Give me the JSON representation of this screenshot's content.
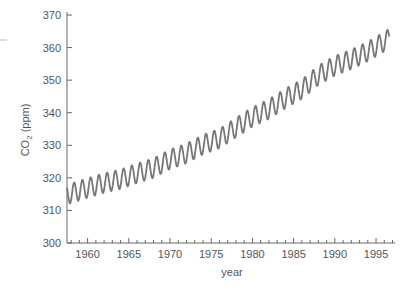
{
  "chart_data": {
    "type": "line",
    "title": "",
    "xlabel": "year",
    "ylabel": "CO2 (ppm)",
    "ylabel_main": "CO",
    "ylabel_sub": "2",
    "ylabel_unit": " (ppm)",
    "xlim": [
      1957.5,
      1997.3
    ],
    "ylim": [
      300,
      370
    ],
    "grid": false,
    "legend": null,
    "x_ticks": [
      1960,
      1965,
      1970,
      1975,
      1980,
      1985,
      1990,
      1995
    ],
    "x_tick_labels": [
      "1960",
      "1965",
      "1970",
      "1975",
      "1980",
      "1985",
      "1990",
      "1995"
    ],
    "y_ticks": [
      300,
      310,
      320,
      330,
      340,
      350,
      360,
      370
    ],
    "y_tick_labels": [
      "300",
      "310",
      "320",
      "330",
      "340",
      "350",
      "360",
      "370"
    ],
    "series": [
      {
        "name": "CO2 concentration (monthly, seasonal cycle)",
        "color": "#777777",
        "seasonal_amplitude_ppm": 3,
        "annual_mean_x": [
          1958,
          1960,
          1962,
          1964,
          1966,
          1968,
          1970,
          1972,
          1974,
          1976,
          1978,
          1980,
          1982,
          1984,
          1986,
          1988,
          1990,
          1992,
          1994,
          1996.5
        ],
        "annual_mean_y": [
          315.3,
          316.9,
          318.4,
          319.6,
          321.4,
          323.0,
          325.7,
          327.5,
          330.2,
          332.1,
          335.4,
          338.7,
          341.1,
          344.4,
          347.2,
          351.5,
          354.4,
          356.4,
          358.8,
          362.6
        ]
      }
    ]
  },
  "colors": {
    "axis": "#666666",
    "text": "#555555",
    "line": "#777777"
  }
}
